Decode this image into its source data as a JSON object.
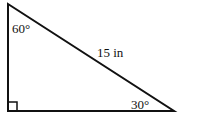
{
  "diagram": {
    "type": "right-triangle",
    "angles": {
      "top": "60°",
      "bottom_right": "30°",
      "bottom_left": "right-angle"
    },
    "hypotenuse_label": "15 in"
  }
}
